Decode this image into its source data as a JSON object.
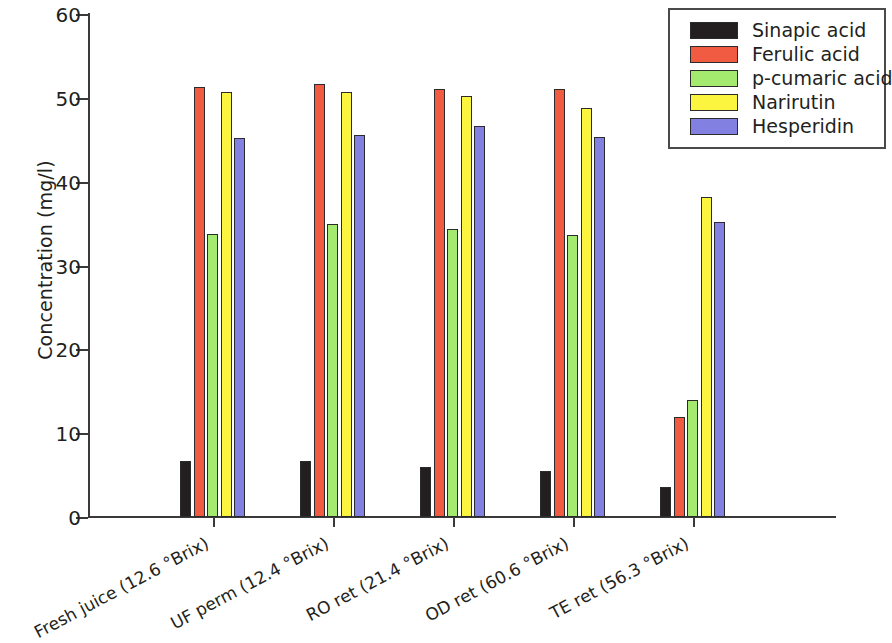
{
  "chart_data": {
    "type": "bar",
    "title": "",
    "xlabel": "",
    "ylabel": "Concentration (mg/l)",
    "ylim": [
      0,
      60
    ],
    "yticks": [
      0,
      10,
      20,
      30,
      40,
      50,
      60
    ],
    "ytick_labels": [
      "0",
      "10",
      "20",
      "30",
      "40",
      "50",
      "60"
    ],
    "grid": false,
    "legend_position": "top-right",
    "categories": [
      "Fresh juice (12.6 °Brix)",
      "UF perm (12.4 °Brix)",
      "RO ret (21.4 °Brix)",
      "OD ret (60.6 °Brix)",
      "TE ret (56.3 °Brix)"
    ],
    "series": [
      {
        "name": "Sinapic acid",
        "color": "#231f20",
        "values": [
          6.7,
          6.7,
          6.0,
          5.5,
          3.6
        ]
      },
      {
        "name": "Ferulic acid",
        "color": "#f15b42",
        "values": [
          51.3,
          51.7,
          51.1,
          51.1,
          11.9
        ]
      },
      {
        "name": "p-cumaric acid",
        "color": "#a4ea6e",
        "values": [
          33.7,
          35.0,
          34.4,
          33.6,
          14.0
        ]
      },
      {
        "name": "Narirutin",
        "color": "#fbf53f",
        "values": [
          50.7,
          50.7,
          50.2,
          48.8,
          38.2
        ]
      },
      {
        "name": "Hesperidin",
        "color": "#8280e0",
        "values": [
          45.2,
          45.6,
          46.7,
          45.3,
          35.2
        ]
      }
    ]
  },
  "legend": {
    "items": [
      {
        "label": "Sinapic acid",
        "color": "#231f20"
      },
      {
        "label": "Ferulic acid",
        "color": "#f15b42"
      },
      {
        "label": "p-cumaric acid",
        "color": "#a4ea6e"
      },
      {
        "label": "Narirutin",
        "color": "#fbf53f"
      },
      {
        "label": "Hesperidin",
        "color": "#8280e0"
      }
    ]
  }
}
